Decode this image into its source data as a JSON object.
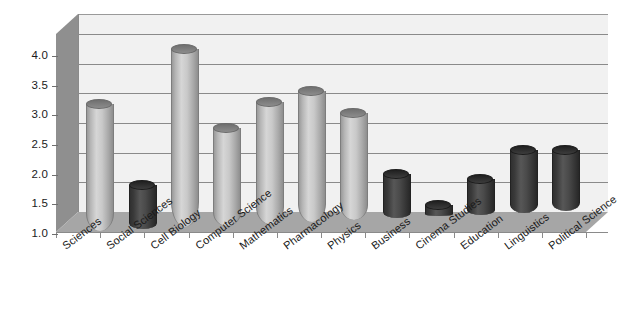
{
  "chart_data": {
    "type": "bar",
    "title": "",
    "subtitle": "",
    "xlabel": "",
    "ylabel": "",
    "ylim": [
      1.0,
      4.0
    ],
    "yticks": [
      "1.0",
      "1.5",
      "2.0",
      "2.5",
      "3.0",
      "3.5",
      "4.0"
    ],
    "ytick_values": [
      1.0,
      1.5,
      2.0,
      2.5,
      3.0,
      3.5,
      4.0
    ],
    "grid": true,
    "legend": "none",
    "style": "3d-cylinder",
    "categories": [
      "Sciences",
      "Social Sciences",
      "Cell Biology",
      "Computer Science",
      "Mathematics",
      "Pharmacology",
      "Physics",
      "Business",
      "Cinema Studies",
      "Education",
      "Linguistics",
      "Political Science"
    ],
    "values": [
      3.15,
      1.75,
      4.0,
      2.65,
      3.05,
      3.2,
      2.8,
      1.75,
      1.2,
      1.6,
      2.05,
      2.02
    ],
    "bar_styles": [
      "light",
      "dark",
      "light",
      "light",
      "light",
      "light",
      "light",
      "dark",
      "dark",
      "dark",
      "dark",
      "dark"
    ],
    "colors": {
      "light_bar": "#c9c9c9",
      "dark_bar": "#3d3d3d",
      "wall": "#f1f1f1",
      "floor": "#a6a6a6",
      "side_wall": "#8f8f8f",
      "gridline": "#8a8a8a",
      "text": "#1a1a1a",
      "background": "#ffffff"
    }
  }
}
